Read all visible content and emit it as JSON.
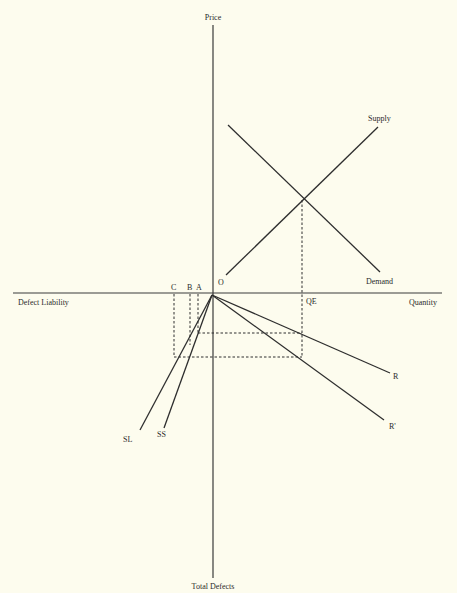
{
  "axes": {
    "y_top": "Price",
    "y_bottom": "Total Defects",
    "x_left": "Defect Liability",
    "x_right": "Quantity"
  },
  "curves": {
    "supply": "Supply",
    "demand": "Demand",
    "r": "R",
    "r_prime": "R'",
    "sl": "SL",
    "ss": "SS"
  },
  "points": {
    "origin": "O",
    "qe": "QE",
    "a": "A",
    "b": "B",
    "c": "C"
  },
  "colors": {
    "background": "#fdfcee",
    "ink": "#2e2e2e"
  }
}
